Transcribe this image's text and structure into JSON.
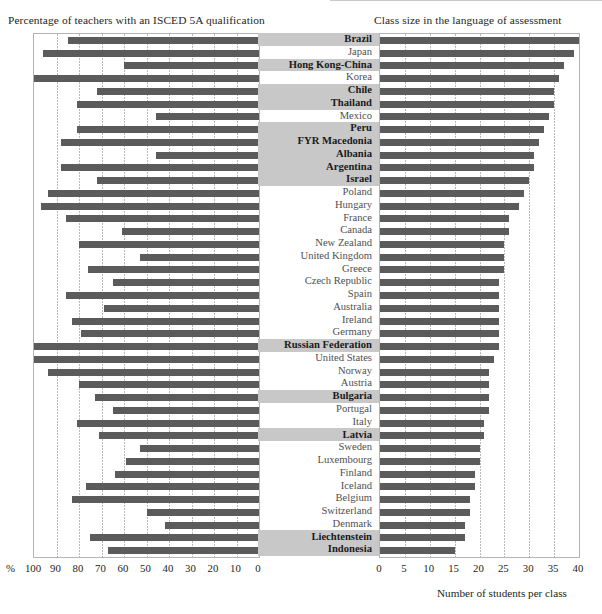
{
  "figure": {
    "left_title": "Percentage of teachers with an ISCED 5A qualification",
    "right_title": "Class size in the language of assessment",
    "left_axis_unit": "%",
    "right_axis_caption": "Number of students per class",
    "bar_color": "#5b5b5b",
    "partner_highlight_color": "#c8c8c8"
  },
  "left_axis": {
    "ticks": [
      "100",
      "90",
      "80",
      "70",
      "60",
      "50",
      "40",
      "30",
      "20",
      "10",
      "0"
    ],
    "min": 0,
    "max": 100,
    "reversed": true
  },
  "right_axis": {
    "ticks": [
      "0",
      "5",
      "10",
      "15",
      "20",
      "25",
      "30",
      "35",
      "40"
    ],
    "min": 0,
    "max": 40,
    "reversed": false
  },
  "chart_data": {
    "type": "bar",
    "orientation": "horizontal",
    "layout": "back-to-back paired horizontal bars sharing a central country label column",
    "grid": true,
    "legend": null,
    "categories": [
      "Brazil",
      "Japan",
      "Hong Kong-China",
      "Korea",
      "Chile",
      "Thailand",
      "Mexico",
      "Peru",
      "FYR Macedonia",
      "Albania",
      "Argentina",
      "Israel",
      "Poland",
      "Hungary",
      "France",
      "Canada",
      "New Zealand",
      "United Kingdom",
      "Greece",
      "Czech Republic",
      "Spain",
      "Australia",
      "Ireland",
      "Germany",
      "Russian Federation",
      "United States",
      "Norway",
      "Austria",
      "Bulgaria",
      "Portugal",
      "Italy",
      "Latvia",
      "Sweden",
      "Luxembourg",
      "Finland",
      "Iceland",
      "Belgium",
      "Switzerland",
      "Denmark",
      "Liechtenstein",
      "Indonesia"
    ],
    "category_types": [
      "partner",
      "oecd",
      "partner",
      "oecd",
      "partner",
      "partner",
      "oecd",
      "partner",
      "partner",
      "partner",
      "partner",
      "partner",
      "oecd",
      "oecd",
      "oecd",
      "oecd",
      "oecd",
      "oecd",
      "oecd",
      "oecd",
      "oecd",
      "oecd",
      "oecd",
      "oecd",
      "partner",
      "oecd",
      "oecd",
      "oecd",
      "partner",
      "oecd",
      "oecd",
      "partner",
      "oecd",
      "oecd",
      "oecd",
      "oecd",
      "oecd",
      "oecd",
      "oecd",
      "partner",
      "partner"
    ],
    "series": [
      {
        "name": "Percentage of teachers with an ISCED 5A qualification",
        "side": "left",
        "xlabel": "%",
        "xlim": [
          0,
          100
        ],
        "values": [
          85,
          96,
          60,
          100,
          72,
          81,
          46,
          81,
          88,
          46,
          88,
          72,
          94,
          97,
          86,
          61,
          80,
          53,
          76,
          65,
          86,
          69,
          83,
          79,
          100,
          100,
          94,
          80,
          73,
          65,
          81,
          71,
          53,
          59,
          64,
          77,
          83,
          50,
          42,
          75,
          67
        ]
      },
      {
        "name": "Class size in the language of assessment",
        "side": "right",
        "xlabel": "Number of students per class",
        "xlim": [
          0,
          40
        ],
        "values": [
          40,
          39,
          37,
          36,
          35,
          35,
          34,
          33,
          32,
          31,
          31,
          30,
          29,
          28,
          26,
          26,
          25,
          25,
          25,
          24,
          24,
          24,
          24,
          24,
          24,
          23,
          22,
          22,
          22,
          22,
          21,
          21,
          20,
          20,
          19,
          19,
          18,
          18,
          17,
          17,
          15
        ]
      }
    ]
  }
}
